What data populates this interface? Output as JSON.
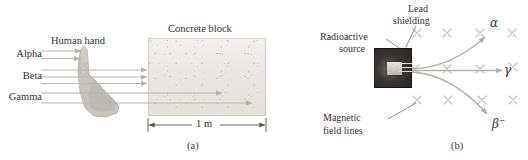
{
  "figure": {
    "panel_a": {
      "caption": "(a)",
      "title": "Concrete block",
      "hand_label": "Human hand",
      "dimension_label": "1 m",
      "ray_labels": [
        {
          "name": "alpha",
          "label": "Alpha",
          "stops_at": "hand",
          "beams": 2
        },
        {
          "name": "beta",
          "label": "Beta",
          "stops_at": "concrete-face",
          "beams": 3
        },
        {
          "name": "gamma",
          "label": "Gamma",
          "stops_at": "through-block",
          "beams": 2
        }
      ]
    },
    "panel_b": {
      "caption": "(b)",
      "source_label": "Radioactive source",
      "source_label_line1": "Radioactive",
      "source_label_line2": "source",
      "shielding_label_line1": "Lead",
      "shielding_label_line2": "shielding",
      "field_label_line1": "Magnetic",
      "field_label_line2": "field lines",
      "field_symbol": "×",
      "field_grid": {
        "rows": 3,
        "cols": 4
      },
      "particles": [
        {
          "name": "alpha",
          "symbol": "α",
          "charge": "",
          "deflection": "up"
        },
        {
          "name": "gamma",
          "symbol": "γ",
          "charge": "",
          "deflection": "none"
        },
        {
          "name": "beta-minus",
          "symbol": "β",
          "charge": "−",
          "deflection": "down"
        }
      ]
    }
  },
  "colors": {
    "ray": "#b9b6b1",
    "field_mark": "#c3c0bb",
    "curve": "#b2afaa",
    "text": "#33312f",
    "leader": "#6e6a65",
    "block": "#eceae7"
  }
}
